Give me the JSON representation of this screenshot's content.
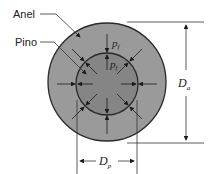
{
  "diagram": {
    "labels": {
      "ring": "Anel",
      "pin": "Pino"
    },
    "pressure_outer": {
      "symbol": "p",
      "subscript": "f"
    },
    "pressure_inner": {
      "symbol": "p",
      "subscript": "f"
    },
    "outer_diameter": {
      "symbol": "D",
      "subscript": "a"
    },
    "pin_diameter": {
      "symbol": "D",
      "subscript": "p"
    },
    "colors": {
      "ring_fill": "#9a9a9a",
      "pin_fill": "#858585",
      "stroke": "#2a2a2a"
    }
  }
}
